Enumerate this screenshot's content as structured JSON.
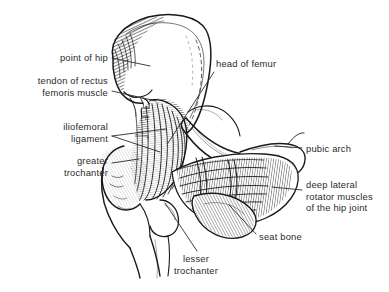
{
  "figure": {
    "style": "pen-and-ink line drawing with hatching",
    "background_color": "#ffffff",
    "ink_color": "#1a1a1a",
    "label_text_color": "#2b2b2b"
  },
  "labels": [
    {
      "id": "point-of-hip",
      "text": "point of hip",
      "align": "right",
      "x": 14,
      "y": 52,
      "width": 94,
      "leader": "M112,58 L150,66"
    },
    {
      "id": "tendon-of-rectus-femoris-muscle",
      "text": "tendon of rectus\nfemoris muscle",
      "align": "right",
      "x": 8,
      "y": 75,
      "width": 100,
      "leader": "M112,91 L156,101"
    },
    {
      "id": "iliofemoral-ligament",
      "text": "iliofemoral\nligament",
      "align": "right",
      "x": 18,
      "y": 121,
      "width": 90,
      "leader": "M112,136 L166,129"
    },
    {
      "id": "greater-trochanter",
      "text": "greater\ntrochanter",
      "align": "right",
      "x": 18,
      "y": 155,
      "width": 90,
      "leader": "M112,163 L139,159"
    },
    {
      "id": "head-of-femur",
      "text": "head of femur",
      "align": "left",
      "x": 216,
      "y": 58,
      "width": 90,
      "leader": "M214,72 L168,143"
    },
    {
      "id": "pubic-arch",
      "text": "pubic arch",
      "align": "left",
      "x": 306,
      "y": 143,
      "width": 80,
      "leader": "M302,148 L275,146"
    },
    {
      "id": "deep-lateral-rotator-muscles",
      "text": "deep lateral\nrotator muscles\nof the hip joint",
      "align": "left",
      "x": 306,
      "y": 179,
      "width": 82,
      "leader": "M302,190 L272,187"
    },
    {
      "id": "seat-bone",
      "text": "seat bone",
      "align": "left",
      "x": 259,
      "y": 231,
      "width": 70,
      "leader": "M256,234 L229,205"
    },
    {
      "id": "lesser-trochanter",
      "text": "lesser\ntrochanter",
      "align": "center",
      "x": 160,
      "y": 253,
      "width": 72,
      "leader": "M197,251 L165,203"
    }
  ]
}
